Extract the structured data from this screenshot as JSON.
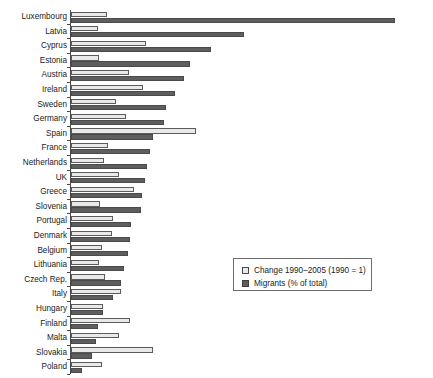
{
  "chart_data": {
    "type": "bar",
    "orientation": "horizontal",
    "title": "",
    "xlabel": "",
    "ylabel": "",
    "grid": false,
    "legend_position": "center-right",
    "xlim": [
      0,
      14
    ],
    "categories": [
      "Luxembourg",
      "Latvia",
      "Cyprus",
      "Estonia",
      "Austria",
      "Ireland",
      "Sweden",
      "Germany",
      "Spain",
      "France",
      "Netherlands",
      "UK",
      "Greece",
      "Slovenia",
      "Portugal",
      "Denmark",
      "Belgium",
      "Lithuania",
      "Czech Rep.",
      "Italy",
      "Hungary",
      "Finland",
      "Malta",
      "Slovakia",
      "Poland"
    ],
    "series": [
      {
        "name": "Change 1990–2005 (1990 = 1)",
        "color": "#e9e9e9",
        "values": [
          1.45,
          1.08,
          3.05,
          1.13,
          2.35,
          2.95,
          1.85,
          2.25,
          5.1,
          1.5,
          1.35,
          1.95,
          2.55,
          1.2,
          1.7,
          1.65,
          1.25,
          1.15,
          1.4,
          2.05,
          1.3,
          2.4,
          1.95,
          3.35,
          1.25
        ]
      },
      {
        "name": "Migrants (% of total)",
        "color": "#5e5e5e",
        "values": [
          13.2,
          7.05,
          5.7,
          4.85,
          4.6,
          4.25,
          3.85,
          3.8,
          3.35,
          3.2,
          3.1,
          3.0,
          2.9,
          2.85,
          2.45,
          2.4,
          2.3,
          2.15,
          2.05,
          1.7,
          1.3,
          1.1,
          1.0,
          0.85,
          0.45
        ]
      }
    ]
  },
  "legend": {
    "entries": [
      {
        "label": "Change 1990–2005 (1990 = 1)",
        "swatch": "sw-change"
      },
      {
        "label": "Migrants (% of total)",
        "swatch": "sw-migrants"
      }
    ]
  }
}
